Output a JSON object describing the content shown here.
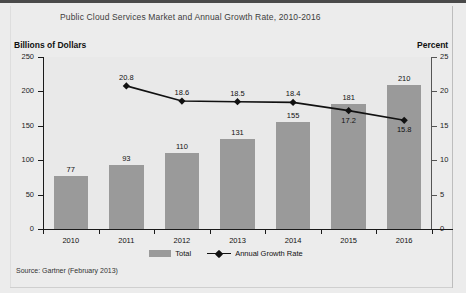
{
  "chart_data": {
    "type": "bar",
    "title": "Public Cloud Services Market and Annual Growth Rate, 2010-2016",
    "categories": [
      "2010",
      "2011",
      "2012",
      "2013",
      "2014",
      "2015",
      "2016"
    ],
    "xlabel": "",
    "ylabel": "Billions of Dollars",
    "y2label": "Percent",
    "ylim": [
      0,
      250
    ],
    "y2lim": [
      0,
      25
    ],
    "yticks": [
      "0",
      "50",
      "100",
      "150",
      "200",
      "250"
    ],
    "y2ticks": [
      "0",
      "5",
      "10",
      "15",
      "20",
      "25"
    ],
    "grid": false,
    "legend_position": "bottom",
    "series": [
      {
        "name": "Total",
        "type": "bar",
        "axis": "left",
        "color": "#9a9a9a",
        "values": [
          77,
          93,
          110,
          131,
          155,
          181,
          210
        ],
        "labels": [
          "77",
          "93",
          "110",
          "131",
          "155",
          "181",
          "210"
        ]
      },
      {
        "name": "Annual Growth Rate",
        "type": "line",
        "axis": "right",
        "color": "#111111",
        "values": [
          null,
          20.8,
          18.6,
          18.5,
          18.4,
          17.2,
          15.8
        ],
        "labels": [
          "",
          "20.8",
          "18.6",
          "18.5",
          "18.4",
          "17.2",
          "15.8"
        ]
      }
    ],
    "source": "Source: Gartner (February 2013)"
  },
  "colors": {
    "bar": "#9a9a9a",
    "line": "#111111",
    "plot_background": "#e9e9e9",
    "page_background": "#ececec"
  }
}
